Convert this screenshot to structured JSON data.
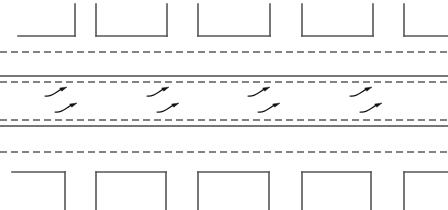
{
  "canvas": {
    "width": 448,
    "height": 210,
    "background": "#ffffff",
    "title": "Urban arterial roadway plan view"
  },
  "style": {
    "line_color": "#4a4a4a",
    "block_stroke": "#555555",
    "dash_color": "#5a5a5a",
    "solid_color": "#4a4a4a",
    "arrow_color": "#111111",
    "block_stroke_width": 1.6,
    "solid_stroke_width": 1.3,
    "dash_stroke_width": 1.3,
    "dash_pattern": "7,4",
    "arrow_stroke_width": 1.2
  },
  "roadway": {
    "label": "arterial-roadway",
    "lane_lines": [
      {
        "name": "north-sidewalk-dash",
        "type": "dashed",
        "y": 52,
        "x1": 0,
        "x2": 448
      },
      {
        "name": "north-edge-solid",
        "type": "solid",
        "y": 76,
        "x1": 0,
        "x2": 448
      },
      {
        "name": "north-lane-dash",
        "type": "dashed",
        "y": 82,
        "x1": 0,
        "x2": 448
      },
      {
        "name": "south-lane-dash",
        "type": "dashed",
        "y": 120,
        "x1": 0,
        "x2": 448
      },
      {
        "name": "south-edge-solid",
        "type": "solid",
        "y": 126,
        "x1": 0,
        "x2": 448
      },
      {
        "name": "south-sidewalk-dash",
        "type": "dashed",
        "y": 152,
        "x1": 0,
        "x2": 448
      }
    ]
  },
  "top_blocks": {
    "label": "north-city-blocks",
    "orientation": "opens-upward",
    "base_y": 36,
    "top_y": 4,
    "items": [
      {
        "name": "block-n1",
        "x1": 18,
        "x2": 75,
        "left_wall": false,
        "right_wall": true
      },
      {
        "name": "block-n2",
        "x1": 96,
        "x2": 167,
        "left_wall": true,
        "right_wall": true
      },
      {
        "name": "block-n3",
        "x1": 198,
        "x2": 270,
        "left_wall": true,
        "right_wall": true
      },
      {
        "name": "block-n4",
        "x1": 302,
        "x2": 373,
        "left_wall": true,
        "right_wall": true
      },
      {
        "name": "block-n5",
        "x1": 404,
        "x2": 448,
        "left_wall": true,
        "right_wall": false
      }
    ]
  },
  "bottom_blocks": {
    "label": "south-city-blocks",
    "orientation": "opens-downward",
    "top_y": 172,
    "base_y": 210,
    "items": [
      {
        "name": "block-s1",
        "x1": 12,
        "x2": 65,
        "left_wall": false,
        "right_wall": true
      },
      {
        "name": "block-s2",
        "x1": 96,
        "x2": 166,
        "left_wall": true,
        "right_wall": true
      },
      {
        "name": "block-s3",
        "x1": 198,
        "x2": 269,
        "left_wall": true,
        "right_wall": true
      },
      {
        "name": "block-s4",
        "x1": 302,
        "x2": 371,
        "left_wall": true,
        "right_wall": true
      },
      {
        "name": "block-s5",
        "x1": 404,
        "x2": 448,
        "left_wall": true,
        "right_wall": false
      }
    ]
  },
  "arrows": {
    "label": "lane-direction-arrows",
    "upper_row": {
      "name": "eastbound-merge-arrows",
      "direction": "up-right",
      "y": 96,
      "items": [
        {
          "name": "arrow-up-1",
          "x": 45
        },
        {
          "name": "arrow-up-2",
          "x": 147
        },
        {
          "name": "arrow-up-3",
          "x": 248
        },
        {
          "name": "arrow-up-4",
          "x": 350
        }
      ]
    },
    "lower_row": {
      "name": "westbound-merge-arrows",
      "direction": "down-left",
      "y": 112,
      "items": [
        {
          "name": "arrow-down-1",
          "x": 55
        },
        {
          "name": "arrow-down-2",
          "x": 157
        },
        {
          "name": "arrow-down-3",
          "x": 258
        },
        {
          "name": "arrow-down-4",
          "x": 360
        }
      ]
    }
  }
}
